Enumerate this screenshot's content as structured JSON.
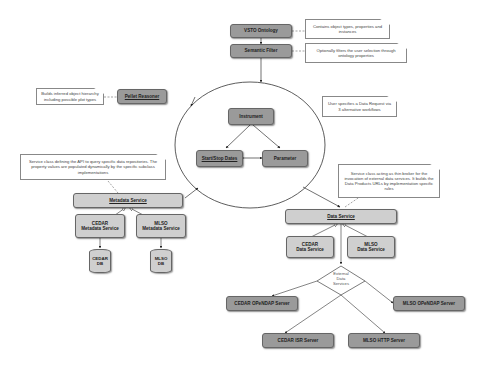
{
  "nodes": {
    "vsto_ontology": "VSTO Ontology",
    "semantic_filter": "Semantic Filter",
    "pellet_reasoner": "Pellet Reasoner",
    "instrument": "Instrument",
    "start_stop_dates": "Start/Stop Dates",
    "parameter": "Parameter",
    "metadata_service": "Metadata Service",
    "cedar_metadata_service": "CEDAR\nMetadata Service",
    "mlso_metadata_service": "MLSO\nMetadata Service",
    "cedar_db": "CEDAR\nDB",
    "mlso_db": "MLSO\nDB",
    "data_service": "Data Service",
    "cedar_data_service": "CEDAR\nData Service",
    "mlso_data_service": "MLSO\nData Service",
    "external_data_services": "External\nData\nServices",
    "cedar_opendap_server": "CEDAR OPeNDAP Server",
    "mlso_opendap_server": "MLSO OPeNDAP Server",
    "cedar_isr_server": "CEDAR ISR Server",
    "mlso_http_server": "MLSO HTTP Server"
  },
  "notes": {
    "ontology_note": "Contains object types, properties and instances",
    "filter_note": "Optionally filters the user selection through ontology properties",
    "reasoner_note": "Builds inferred object hierarchy including possible plot types",
    "user_note": "User specifies a Data Request via 3 alternative workflows",
    "metadata_note": "Service class defining the API to query specific data repositories. The property values are populated dynamically by the specific subclass implementations",
    "data_note": "Service class acting as thin broker for the invocation of external data services. It builds the Data Products URLs by implementation specific rules"
  }
}
